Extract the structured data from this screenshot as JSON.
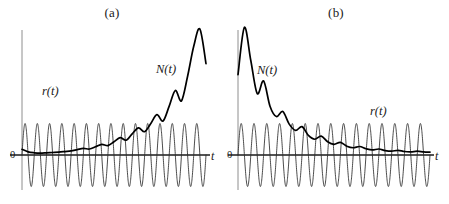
{
  "figure": {
    "background_color": "#ffffff",
    "panel_count": 2
  },
  "panels": [
    {
      "caption": "(a)",
      "origin_label": "0",
      "x_axis_label": "t",
      "carrier_label": "r(t)",
      "envelope_label": "N(t)"
    },
    {
      "caption": "(b)",
      "origin_label": "0",
      "x_axis_label": "t",
      "carrier_label": "r(t)",
      "envelope_label": "N(t)"
    }
  ],
  "chart_data": [
    {
      "type": "line",
      "title": "(a)",
      "xlabel": "t",
      "ylabel": "",
      "grid": false,
      "legend": "inline-annotations",
      "axis_ranges": {
        "x": [
          0,
          15
        ],
        "y": [
          -1.15,
          4.2
        ]
      },
      "annotations": [
        {
          "text": "r(t)",
          "x": 1.9,
          "y": 1.55
        },
        {
          "text": "N(t)",
          "x": 10.6,
          "y": 2.35
        },
        {
          "text": "0",
          "x": -0.35,
          "y": -0.2
        },
        {
          "text": "t",
          "x": 15.0,
          "y": -0.22
        }
      ],
      "series": [
        {
          "name": "r(t)",
          "description": "constant amplitude sinusoid, 15 cycles, amplitude 1.0, centered on t-axis",
          "form": "A*sin(2*pi*f*t)",
          "amplitude": 1.0,
          "cycles": 15,
          "color": "#2b2b2b",
          "line_width": 0.8,
          "x": [
            0,
            15
          ],
          "values": []
        },
        {
          "name": "N(t)",
          "description": "exponentially growing oscillatory response; starts near 0.15, ripples grow, final peak ~4.0 then drops to ~2.9",
          "color": "#000000",
          "line_width": 1.7,
          "x": [
            0,
            0.5,
            1,
            1.5,
            2,
            2.5,
            3,
            3.5,
            4,
            4.5,
            5,
            5.5,
            6,
            6.5,
            7,
            7.5,
            8,
            8.5,
            9,
            9.5,
            10,
            10.5,
            11,
            11.5,
            12,
            12.5,
            13,
            13.5,
            14,
            14.5,
            15
          ],
          "values": [
            0.18,
            0.1,
            0.07,
            0.06,
            0.07,
            0.08,
            0.09,
            0.11,
            0.13,
            0.17,
            0.21,
            0.19,
            0.26,
            0.34,
            0.3,
            0.42,
            0.55,
            0.47,
            0.68,
            0.86,
            0.74,
            1.0,
            1.28,
            1.08,
            1.55,
            2.05,
            1.72,
            2.5,
            3.45,
            4.0,
            2.9
          ]
        }
      ]
    },
    {
      "type": "line",
      "title": "(b)",
      "xlabel": "t",
      "ylabel": "",
      "grid": false,
      "legend": "inline-annotations",
      "axis_ranges": {
        "x": [
          0,
          15
        ],
        "y": [
          -1.15,
          4.2
        ]
      },
      "annotations": [
        {
          "text": "N(t)",
          "x": 1.6,
          "y": 2.75
        },
        {
          "text": "r(t)",
          "x": 11.4,
          "y": 1.45
        },
        {
          "text": "0",
          "x": -0.35,
          "y": -0.2
        },
        {
          "text": "t",
          "x": 15.0,
          "y": -0.22
        }
      ],
      "series": [
        {
          "name": "r(t)",
          "description": "constant amplitude sinusoid, 15 cycles, amplitude 1.0, centered on t-axis",
          "form": "A*sin(2*pi*f*t)",
          "amplitude": 1.0,
          "cycles": 15,
          "color": "#2b2b2b",
          "line_width": 0.8,
          "x": [
            0,
            15
          ],
          "values": []
        },
        {
          "name": "N(t)",
          "description": "exponentially decaying oscillatory response; starts ~2.55, first peak ~4.05, decays to near 0.1",
          "color": "#000000",
          "line_width": 1.7,
          "x": [
            0,
            0.5,
            1,
            1.5,
            2,
            2.5,
            3,
            3.5,
            4,
            4.5,
            5,
            5.5,
            6,
            6.5,
            7,
            7.5,
            8,
            8.5,
            9,
            9.5,
            10,
            10.5,
            11,
            11.5,
            12,
            12.5,
            13,
            13.5,
            14,
            14.5,
            15
          ],
          "values": [
            2.55,
            4.05,
            3.0,
            1.95,
            2.35,
            1.55,
            1.22,
            1.38,
            0.98,
            0.78,
            0.9,
            0.62,
            0.5,
            0.6,
            0.42,
            0.34,
            0.4,
            0.28,
            0.23,
            0.27,
            0.2,
            0.16,
            0.19,
            0.14,
            0.12,
            0.15,
            0.11,
            0.1,
            0.12,
            0.1,
            0.09
          ]
        }
      ]
    }
  ],
  "colors": {
    "curve_dark": "#000000",
    "carrier": "#2b2b2b",
    "axis_vertical": "#8e8e8e",
    "axis_horizontal": "#1a1a1a",
    "background": "#ffffff"
  }
}
